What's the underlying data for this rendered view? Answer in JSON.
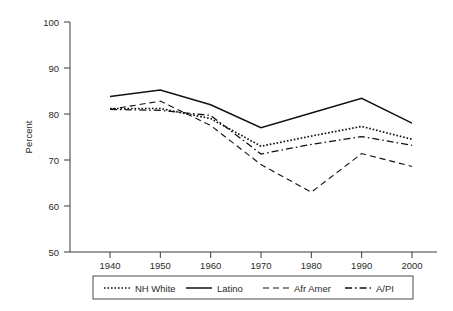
{
  "chart_data": {
    "type": "line",
    "title": "",
    "subtitle": "",
    "xlabel": "",
    "ylabel": "Percent",
    "x": [
      1940,
      1950,
      1960,
      1970,
      1980,
      1990,
      2000
    ],
    "xtick_labels": [
      "1940",
      "1950",
      "1960",
      "1970",
      "1980",
      "1990",
      "2000"
    ],
    "ytick_labels": [
      "50",
      "60",
      "70",
      "80",
      "90",
      "100"
    ],
    "yticks": [
      50,
      60,
      70,
      80,
      90,
      100
    ],
    "xlim": [
      1935,
      2005
    ],
    "ylim": [
      50,
      100
    ],
    "grid": false,
    "legend_position": "bottom",
    "series": [
      {
        "name": "NH White",
        "dash": "dotted",
        "values": [
          81.2,
          81.2,
          79.0,
          73.0,
          75.2,
          77.3,
          74.5
        ]
      },
      {
        "name": "Latino",
        "dash": "solid",
        "values": [
          83.8,
          85.2,
          82.0,
          77.0,
          80.2,
          83.4,
          78.0
        ]
      },
      {
        "name": "Afr Amer",
        "dash": "dashed",
        "values": [
          81.0,
          82.8,
          77.5,
          69.0,
          63.0,
          71.4,
          68.6
        ]
      },
      {
        "name": "A/PI",
        "dash": "dashdot",
        "values": [
          81.0,
          80.8,
          79.7,
          71.3,
          73.4,
          75.1,
          73.2
        ]
      }
    ]
  },
  "legend": {
    "entries": [
      {
        "label": "NH White",
        "dash": "dotted"
      },
      {
        "label": "Latino",
        "dash": "solid"
      },
      {
        "label": "Afr Amer",
        "dash": "dashed"
      },
      {
        "label": "A/PI",
        "dash": "dashdot"
      }
    ]
  },
  "colors": {
    "line": "#111111",
    "axis": "#3a3a3a",
    "text": "#2b2b2b",
    "background": "#ffffff"
  }
}
